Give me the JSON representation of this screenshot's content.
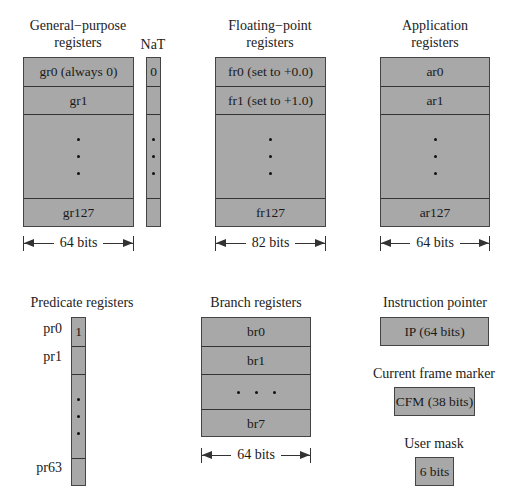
{
  "general_purpose": {
    "title_line1": "General−purpose",
    "title_line2": "registers",
    "rows": [
      "gr0 (always 0)",
      "gr1",
      "gr127"
    ],
    "width_label": "64 bits"
  },
  "nat": {
    "title": "NaT",
    "first_value": "0"
  },
  "floating_point": {
    "title_line1": "Floating−point",
    "title_line2": "registers",
    "rows": [
      "fr0 (set to +0.0)",
      "fr1 (set to +1.0)",
      "fr127"
    ],
    "width_label": "82 bits"
  },
  "application": {
    "title_line1": "Application",
    "title_line2": "registers",
    "rows": [
      "ar0",
      "ar1",
      "ar127"
    ],
    "width_label": "64 bits"
  },
  "predicate": {
    "title": "Predicate registers",
    "row_labels": [
      "pr0",
      "pr1",
      "pr63"
    ],
    "first_value": "1"
  },
  "branch": {
    "title": "Branch registers",
    "rows": [
      "br0",
      "br1",
      "br7"
    ],
    "width_label": "64 bits"
  },
  "instruction_pointer": {
    "title": "Instruction pointer",
    "value": "IP (64 bits)"
  },
  "current_frame_marker": {
    "title": "Current frame marker",
    "value": "CFM (38 bits)"
  },
  "user_mask": {
    "title": "User mask",
    "value": "6 bits"
  },
  "colors": {
    "register_fill": "#a8a8a8",
    "border": "#444444",
    "background": "#ffffff"
  }
}
